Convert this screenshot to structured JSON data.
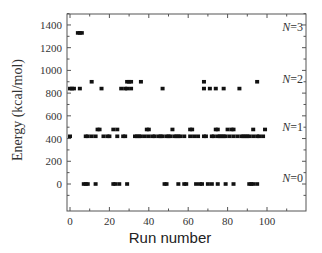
{
  "chart_data": {
    "type": "scatter",
    "title": "",
    "xlabel": "Run number",
    "ylabel": "Energy (kcal/mol)",
    "xlim": [
      -1,
      119
    ],
    "ylim": [
      -120,
      1560
    ],
    "xticks": [
      0,
      20,
      40,
      60,
      80,
      100
    ],
    "yticks": [
      0,
      200,
      400,
      600,
      800,
      1000,
      1200,
      1400
    ],
    "grid": false,
    "legend": "none",
    "annotations": [
      {
        "text": "N=3",
        "y": 1330
      },
      {
        "text": "N=2",
        "y": 870
      },
      {
        "text": "N=1",
        "y": 450
      },
      {
        "text": "N=0",
        "y": 0
      }
    ],
    "series": [
      {
        "name": "N=3",
        "points": [
          [
            4,
            1330
          ],
          [
            5,
            1330
          ],
          [
            6,
            1330
          ]
        ]
      },
      {
        "name": "N=2",
        "points": [
          [
            0,
            840
          ],
          [
            1,
            840
          ],
          [
            2,
            840
          ],
          [
            5,
            840
          ],
          [
            11,
            900
          ],
          [
            16,
            840
          ],
          [
            26,
            840
          ],
          [
            28,
            840
          ],
          [
            29,
            840
          ],
          [
            29,
            900
          ],
          [
            30,
            900
          ],
          [
            31,
            900
          ],
          [
            31,
            840
          ],
          [
            36,
            900
          ],
          [
            47,
            840
          ],
          [
            68,
            840
          ],
          [
            68,
            900
          ],
          [
            71,
            840
          ],
          [
            74,
            840
          ],
          [
            78,
            840
          ],
          [
            86,
            840
          ],
          [
            95,
            900
          ]
        ]
      },
      {
        "name": "N=1",
        "points": [
          [
            0,
            420
          ],
          [
            8,
            420
          ],
          [
            9,
            420
          ],
          [
            11,
            420
          ],
          [
            13,
            420
          ],
          [
            14,
            480
          ],
          [
            15,
            480
          ],
          [
            17,
            420
          ],
          [
            19,
            420
          ],
          [
            20,
            420
          ],
          [
            22,
            480
          ],
          [
            24,
            480
          ],
          [
            24,
            420
          ],
          [
            27,
            420
          ],
          [
            28,
            420
          ],
          [
            33,
            420
          ],
          [
            34,
            420
          ],
          [
            35,
            420
          ],
          [
            36,
            420
          ],
          [
            38,
            420
          ],
          [
            39,
            480
          ],
          [
            40,
            480
          ],
          [
            40,
            420
          ],
          [
            42,
            420
          ],
          [
            43,
            420
          ],
          [
            45,
            420
          ],
          [
            46,
            420
          ],
          [
            47,
            420
          ],
          [
            49,
            420
          ],
          [
            50,
            420
          ],
          [
            51,
            420
          ],
          [
            52,
            480
          ],
          [
            53,
            420
          ],
          [
            54,
            420
          ],
          [
            55,
            420
          ],
          [
            56,
            420
          ],
          [
            58,
            420
          ],
          [
            61,
            480
          ],
          [
            61,
            420
          ],
          [
            62,
            480
          ],
          [
            63,
            420
          ],
          [
            65,
            420
          ],
          [
            68,
            420
          ],
          [
            69,
            420
          ],
          [
            72,
            420
          ],
          [
            73,
            420
          ],
          [
            74,
            480
          ],
          [
            75,
            480
          ],
          [
            75,
            420
          ],
          [
            76,
            420
          ],
          [
            77,
            420
          ],
          [
            78,
            420
          ],
          [
            79,
            420
          ],
          [
            80,
            480
          ],
          [
            81,
            420
          ],
          [
            82,
            480
          ],
          [
            83,
            480
          ],
          [
            83,
            420
          ],
          [
            85,
            420
          ],
          [
            87,
            420
          ],
          [
            88,
            420
          ],
          [
            89,
            420
          ],
          [
            90,
            420
          ],
          [
            91,
            420
          ],
          [
            93,
            480
          ],
          [
            93,
            420
          ],
          [
            95,
            420
          ],
          [
            96,
            420
          ],
          [
            98,
            420
          ],
          [
            99,
            480
          ]
        ]
      },
      {
        "name": "N=0",
        "points": [
          [
            7,
            0
          ],
          [
            8,
            0
          ],
          [
            9,
            0
          ],
          [
            13,
            0
          ],
          [
            22,
            0
          ],
          [
            23,
            0
          ],
          [
            25,
            0
          ],
          [
            29,
            0
          ],
          [
            48,
            0
          ],
          [
            49,
            0
          ],
          [
            55,
            0
          ],
          [
            58,
            0
          ],
          [
            59,
            0
          ],
          [
            64,
            0
          ],
          [
            66,
            0
          ],
          [
            67,
            0
          ],
          [
            70,
            0
          ],
          [
            72,
            0
          ],
          [
            75,
            0
          ],
          [
            79,
            0
          ],
          [
            83,
            0
          ],
          [
            91,
            0
          ],
          [
            92,
            0
          ],
          [
            93,
            0
          ],
          [
            95,
            0
          ]
        ]
      }
    ]
  },
  "axes": {
    "xlabel": "Run number",
    "ylabel": "Energy (kcal/mol)"
  }
}
